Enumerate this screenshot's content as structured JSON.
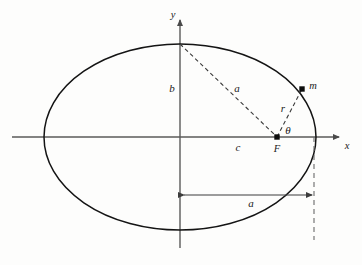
{
  "figure": {
    "background_color": "#fdfdfc",
    "stroke_color": "#1a1a1a",
    "axis_color": "#555555",
    "dash_color": "#3a3a3a"
  },
  "axes": {
    "x_label": "x",
    "y_label": "y",
    "x_axis": {
      "x1": 12,
      "y1": 137,
      "x2": 344,
      "y2": 137,
      "arrow": "right"
    },
    "y_axis": {
      "x1": 180,
      "y1": 248,
      "x2": 180,
      "y2": 15,
      "arrow": "up"
    },
    "x_label_pos": {
      "x": 347,
      "y": 146
    },
    "y_label_pos": {
      "x": 173,
      "y": 15
    }
  },
  "ellipse": {
    "cx": 180,
    "cy": 137,
    "rx": 136,
    "ry": 93
  },
  "points": [
    {
      "name": "focus",
      "label": "F",
      "x": 277,
      "y": 137,
      "label_x": 277,
      "label_y": 148,
      "marker": "square"
    },
    {
      "name": "mass",
      "label": "m",
      "x": 302,
      "y": 89,
      "label_x": 312,
      "label_y": 86,
      "marker": "square"
    }
  ],
  "segments": [
    {
      "name": "semi-major-dashed",
      "label": "a",
      "x1": 180,
      "y1": 44,
      "x2": 277,
      "y2": 137,
      "label_x": 237,
      "label_y": 88,
      "style": "dashed"
    },
    {
      "name": "radius-dashed",
      "label": "r",
      "x1": 277,
      "y1": 137,
      "x2": 302,
      "y2": 89,
      "label_x": 283,
      "label_y": 108,
      "style": "dashed"
    }
  ],
  "labels": [
    {
      "name": "semi-minor-label",
      "text": "b",
      "x": 172,
      "y": 88
    },
    {
      "name": "focal-distance-label",
      "text": "c",
      "x": 238,
      "y": 147
    },
    {
      "name": "angle-label",
      "text": "θ",
      "x": 288,
      "y": 130
    },
    {
      "name": "semi-major-dimension-label",
      "text": "a",
      "x": 251,
      "y": 203
    }
  ],
  "dimension_line": {
    "name": "semi-major-dimension",
    "x1": 182,
    "x2": 314,
    "y": 195,
    "label": "a",
    "arrows": "both"
  },
  "guide_line": {
    "name": "vertical-dashed-guide",
    "x": 314,
    "y1": 137,
    "y2": 240,
    "style": "dashed"
  }
}
